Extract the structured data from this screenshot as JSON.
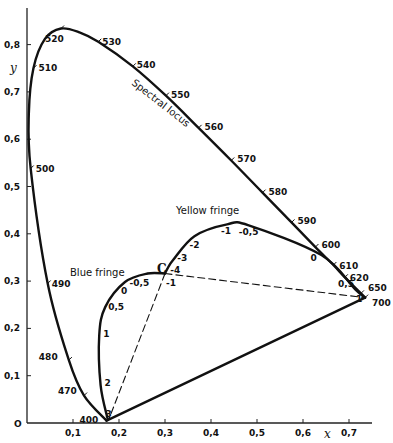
{
  "chart_data": {
    "type": "line",
    "title": "",
    "xlabel": "x",
    "ylabel": "y",
    "xlim": [
      0,
      0.75
    ],
    "ylim": [
      0,
      0.87
    ],
    "grid": false,
    "x_ticks": [
      {
        "value": 0.1,
        "label": "0,1"
      },
      {
        "value": 0.2,
        "label": "0,2"
      },
      {
        "value": 0.3,
        "label": "0,3"
      },
      {
        "value": 0.4,
        "label": "0,4"
      },
      {
        "value": 0.5,
        "label": "0,5"
      },
      {
        "value": 0.6,
        "label": "0,6"
      },
      {
        "value": 0.7,
        "label": "0,7"
      }
    ],
    "y_ticks": [
      {
        "value": 0.1,
        "label": "0,1"
      },
      {
        "value": 0.2,
        "label": "0,2"
      },
      {
        "value": 0.3,
        "label": "0,3"
      },
      {
        "value": 0.4,
        "label": "0,4"
      },
      {
        "value": 0.5,
        "label": "0,5"
      },
      {
        "value": 0.6,
        "label": "0,6"
      },
      {
        "value": 0.7,
        "label": "0,7"
      },
      {
        "value": 0.8,
        "label": "0,8"
      }
    ],
    "origin_label": "O",
    "series": [
      {
        "name": "Spectral locus",
        "label": "Spectral locus",
        "style": "solid",
        "points": [
          {
            "nm": 400,
            "x": 0.173,
            "y": 0.005
          },
          {
            "nm": 470,
            "x": 0.124,
            "y": 0.058
          },
          {
            "nm": 480,
            "x": 0.091,
            "y": 0.133
          },
          {
            "nm": 490,
            "x": 0.045,
            "y": 0.295
          },
          {
            "nm": 500,
            "x": 0.008,
            "y": 0.538
          },
          {
            "nm": 505,
            "x": 0.004,
            "y": 0.655
          },
          {
            "nm": 510,
            "x": 0.014,
            "y": 0.75
          },
          {
            "nm": 515,
            "x": 0.039,
            "y": 0.812
          },
          {
            "nm": 520,
            "x": 0.074,
            "y": 0.834
          },
          {
            "nm": 525,
            "x": 0.114,
            "y": 0.826
          },
          {
            "nm": 530,
            "x": 0.155,
            "y": 0.806
          },
          {
            "nm": 540,
            "x": 0.23,
            "y": 0.754
          },
          {
            "nm": 550,
            "x": 0.302,
            "y": 0.692
          },
          {
            "nm": 560,
            "x": 0.373,
            "y": 0.624
          },
          {
            "nm": 570,
            "x": 0.444,
            "y": 0.555
          },
          {
            "nm": 580,
            "x": 0.512,
            "y": 0.487
          },
          {
            "nm": 590,
            "x": 0.575,
            "y": 0.424
          },
          {
            "nm": 600,
            "x": 0.627,
            "y": 0.372
          },
          {
            "nm": 610,
            "x": 0.666,
            "y": 0.334
          },
          {
            "nm": 620,
            "x": 0.691,
            "y": 0.308
          },
          {
            "nm": 650,
            "x": 0.726,
            "y": 0.274
          },
          {
            "nm": 700,
            "x": 0.735,
            "y": 0.265
          }
        ],
        "labeled_wavelengths": [
          "400",
          "470",
          "480",
          "490",
          "500",
          "510",
          "520",
          "530",
          "540",
          "550",
          "560",
          "570",
          "580",
          "590",
          "600",
          "610",
          "620",
          "650",
          "700"
        ]
      },
      {
        "name": "Blue fringe",
        "label": "Blue fringe",
        "style": "solid",
        "points": [
          {
            "t": "3",
            "x": 0.175,
            "y": 0.01
          },
          {
            "t": "2",
            "x": 0.16,
            "y": 0.08
          },
          {
            "t": "1",
            "x": 0.157,
            "y": 0.185
          },
          {
            "t": "0,5",
            "x": 0.17,
            "y": 0.245
          },
          {
            "t": "0",
            "x": 0.213,
            "y": 0.298
          },
          {
            "t": "-0,5",
            "x": 0.262,
            "y": 0.316
          },
          {
            "t": "C",
            "x": 0.3,
            "y": 0.316
          }
        ],
        "labeled_points": [
          "3",
          "2",
          "1",
          "0,5",
          "0",
          "-0,5",
          "-1"
        ]
      },
      {
        "name": "Yellow fringe",
        "label": "Yellow fringe",
        "style": "solid",
        "points": [
          {
            "t": "C",
            "x": 0.3,
            "y": 0.316
          },
          {
            "t": "-4",
            "x": 0.305,
            "y": 0.326
          },
          {
            "t": "-3",
            "x": 0.318,
            "y": 0.345
          },
          {
            "t": "-2",
            "x": 0.364,
            "y": 0.395
          },
          {
            "t": "-1",
            "x": 0.435,
            "y": 0.42
          },
          {
            "t": "-0,5",
            "x": 0.482,
            "y": 0.418
          },
          {
            "t": "0",
            "x": 0.64,
            "y": 0.355
          },
          {
            "t": "0,5",
            "x": 0.713,
            "y": 0.283
          },
          {
            "t": "1",
            "x": 0.735,
            "y": 0.265
          }
        ],
        "labeled_points": [
          "-4",
          "-3",
          "-2",
          "-1",
          "-0,5",
          "0",
          "0,5",
          "1"
        ]
      },
      {
        "name": "Purple line",
        "style": "solid",
        "points": [
          {
            "x": 0.173,
            "y": 0.005
          },
          {
            "x": 0.735,
            "y": 0.265
          }
        ]
      },
      {
        "name": "Dashed line C to 400 nm",
        "style": "dashed",
        "points": [
          {
            "x": 0.3,
            "y": 0.316
          },
          {
            "x": 0.178,
            "y": 0.008
          }
        ]
      },
      {
        "name": "Dashed line C to 700 nm",
        "style": "dashed",
        "points": [
          {
            "x": 0.3,
            "y": 0.316
          },
          {
            "x": 0.735,
            "y": 0.265
          }
        ]
      }
    ],
    "annotations": {
      "spectral_locus": "Spectral locus",
      "yellow_fringe": "Yellow fringe",
      "blue_fringe": "Blue fringe",
      "white_point": "C"
    }
  }
}
